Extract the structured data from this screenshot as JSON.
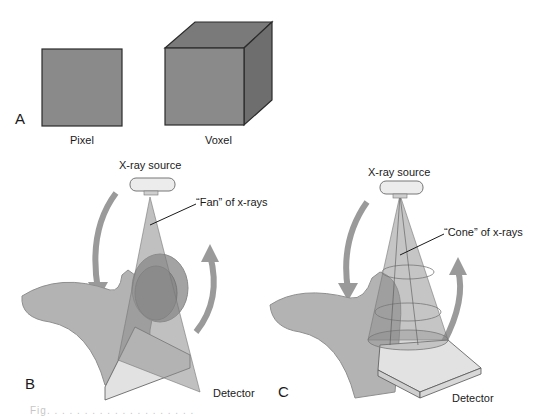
{
  "panel_a": {
    "letter": "A",
    "pixel_label": "Pixel",
    "voxel_label": "Voxel"
  },
  "panel_b": {
    "letter": "B",
    "source_label": "X-ray source",
    "beam_label": "“Fan” of x-rays",
    "detector_label": "Detector"
  },
  "panel_c": {
    "letter": "C",
    "source_label": "X-ray source",
    "beam_label": "“Cone” of x-rays",
    "detector_label": "Detector"
  },
  "colors": {
    "shape_fill": "#8a8a8a",
    "shape_stroke": "#2b2b2b",
    "tissue": "#b3b3b3",
    "beam": "#8c8c8c",
    "arrow": "#9a9a9a",
    "detector": "#e2e2e2"
  },
  "caption": "Fig. . . . . . . . . . . . . . . . . . . ."
}
